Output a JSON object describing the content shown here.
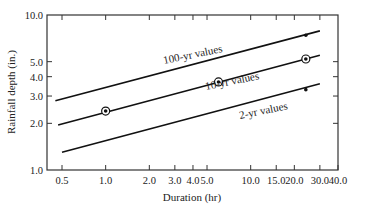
{
  "chart_data": {
    "type": "line",
    "title": "",
    "xlabel": "Duration (hr)",
    "ylabel": "Rainfall depth (in.)",
    "xscale": "log",
    "yscale": "log",
    "xlim": [
      0.4,
      40.0
    ],
    "ylim": [
      1.0,
      10.0
    ],
    "grid": false,
    "legend": "inline labels on lines",
    "x_ticks": [
      0.5,
      1.0,
      2.0,
      3.0,
      4.0,
      5.0,
      10.0,
      15.0,
      20.0,
      30.0,
      40.0
    ],
    "x_tick_labels": [
      "0.5",
      "1.0",
      "2.0",
      "3.0",
      "4.0",
      "5.0",
      "10.0",
      "15.0",
      "20.0",
      "30.0",
      "40.0"
    ],
    "y_ticks": [
      1.0,
      2.0,
      3.0,
      4.0,
      5.0,
      10.0
    ],
    "y_tick_labels": [
      "1.0",
      "2.0",
      "3.0",
      "4.0",
      "5.0",
      "10.0"
    ],
    "series": [
      {
        "name": "100-yr values",
        "x": [
          0.45,
          30.0
        ],
        "values": [
          2.8,
          7.9
        ],
        "markers": [
          {
            "x": 24.0,
            "y": 7.4,
            "style": "dot"
          }
        ]
      },
      {
        "name": "10-yr values",
        "x": [
          0.47,
          30.0
        ],
        "values": [
          1.95,
          5.5
        ],
        "markers": [
          {
            "x": 1.0,
            "y": 2.4,
            "style": "circled-dot"
          },
          {
            "x": 6.0,
            "y": 3.7,
            "style": "circled-dot"
          },
          {
            "x": 24.0,
            "y": 5.2,
            "style": "circled-dot"
          }
        ]
      },
      {
        "name": "2-yr values",
        "x": [
          0.5,
          30.0
        ],
        "values": [
          1.3,
          3.6
        ],
        "markers": [
          {
            "x": 24.0,
            "y": 3.3,
            "style": "dot"
          }
        ]
      }
    ]
  },
  "labels": {
    "series_100": "100-yr values",
    "series_10": "10-yr values",
    "series_2": "2-yr values",
    "xlabel": "Duration (hr)",
    "ylabel": "Rainfall depth (in.)"
  }
}
